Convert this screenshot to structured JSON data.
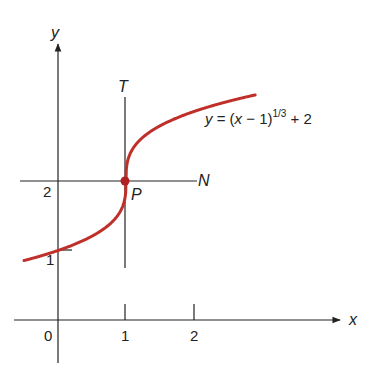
{
  "figure": {
    "equation_label": {
      "y": "y",
      "eq": " = (",
      "x": "x",
      "rest": " − 1)",
      "exponent": "1/3",
      "tail": " + 2"
    },
    "axis_labels": {
      "x": "x",
      "y": "y"
    },
    "x_ticks": [
      "0",
      "1",
      "2"
    ],
    "y_ticks": [
      "1",
      "2"
    ],
    "point_label": "P",
    "tangent_label": "T",
    "normal_label": "N",
    "colors": {
      "curve": "#c0302a",
      "axes": "#222222",
      "point": "#b02020"
    }
  },
  "chart_data": {
    "type": "line",
    "title": "",
    "function": "y = (x - 1)^(1/3) + 2",
    "xlabel": "x",
    "ylabel": "y",
    "xlim": [
      -0.65,
      4.0
    ],
    "ylim": [
      -0.6,
      3.9
    ],
    "x_ticks": [
      0,
      1,
      2
    ],
    "y_ticks": [
      1,
      2
    ],
    "grid": false,
    "series": [
      {
        "name": "y = (x - 1)^(1/3) + 2",
        "x": [
          -0.5,
          0,
          0.5,
          0.9,
          0.99,
          1,
          1.01,
          1.1,
          1.5,
          2,
          2.5,
          2.9
        ],
        "y": [
          0.855,
          1.0,
          1.206,
          1.536,
          1.785,
          2.0,
          2.215,
          2.464,
          2.794,
          3.0,
          3.145,
          3.239
        ]
      }
    ],
    "annotations": [
      {
        "label": "P",
        "x": 1,
        "y": 2,
        "note": "point of vertical tangency"
      },
      {
        "label": "T",
        "type": "vertical tangent line",
        "x": 1
      },
      {
        "label": "N",
        "type": "horizontal normal line",
        "y": 2
      }
    ]
  }
}
